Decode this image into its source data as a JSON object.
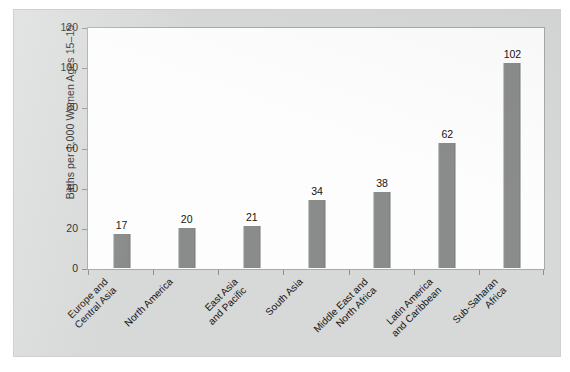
{
  "chart_data": {
    "type": "bar",
    "title": "",
    "xlabel": "",
    "ylabel": "Births per 1,000 Women Ages 15–19",
    "ylim": [
      0,
      120
    ],
    "yticks": [
      0,
      20,
      40,
      60,
      80,
      100,
      120
    ],
    "grid": false,
    "legend": "none",
    "bar_color": "#8a8b8b",
    "panel_color": "#d7d8d8",
    "plot_bg_color": "#fdfdfd",
    "categories": [
      "Europe and Central Asia",
      "North America",
      "East Asia and Pacific",
      "South Asia",
      "Middle East and North Africa",
      "Latin America and Caribbean",
      "Sub-Saharan Africa"
    ],
    "category_label_lines": [
      [
        "Europe and",
        "Central Asia"
      ],
      [
        "North America"
      ],
      [
        "East Asia",
        "and Pacific"
      ],
      [
        "South Asia"
      ],
      [
        "Middle East and",
        "North Africa"
      ],
      [
        "Latin America",
        "and Caribbean"
      ],
      [
        "Sub-Saharan",
        "Africa"
      ]
    ],
    "values": [
      17,
      20,
      21,
      34,
      38,
      62,
      102
    ],
    "value_labels": [
      "17",
      "20",
      "21",
      "34",
      "38",
      "62",
      "102"
    ],
    "ytick_labels": [
      "0",
      "20",
      "40",
      "60",
      "80",
      "100",
      "120"
    ]
  }
}
